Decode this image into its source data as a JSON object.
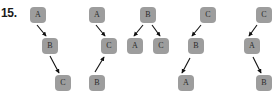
{
  "problem": {
    "number_label": "15.",
    "colors": {
      "node_fill": "#9d9d9d",
      "node_text": "#2b2b2b",
      "arrow": "#111111",
      "background": "#ffffff",
      "number_text": "#1a1a1a"
    }
  },
  "diagrams": [
    {
      "id": "diagram-1",
      "nodes": [
        {
          "label": "A",
          "x": 30,
          "y": 7
        },
        {
          "label": "B",
          "x": 42,
          "y": 38
        },
        {
          "label": "C",
          "x": 55,
          "y": 75
        }
      ],
      "edges": [
        {
          "from": "A",
          "to": "B",
          "x1": 37,
          "y1": 25,
          "x2": 46,
          "y2": 36
        },
        {
          "from": "B",
          "to": "C",
          "x1": 50,
          "y1": 56,
          "x2": 59,
          "y2": 73
        }
      ]
    },
    {
      "id": "diagram-2",
      "nodes": [
        {
          "label": "A",
          "x": 89,
          "y": 7
        },
        {
          "label": "C",
          "x": 101,
          "y": 38
        },
        {
          "label": "B",
          "x": 89,
          "y": 75
        }
      ],
      "edges": [
        {
          "from": "A",
          "to": "C",
          "x1": 96,
          "y1": 25,
          "x2": 105,
          "y2": 36
        },
        {
          "from": "B",
          "to": "C",
          "x1": 95,
          "y1": 72,
          "x2": 104,
          "y2": 57
        }
      ]
    },
    {
      "id": "diagram-3",
      "nodes": [
        {
          "label": "B",
          "x": 140,
          "y": 7
        },
        {
          "label": "A",
          "x": 127,
          "y": 38
        },
        {
          "label": "C",
          "x": 153,
          "y": 38
        }
      ],
      "edges": [
        {
          "from": "B",
          "to": "A",
          "x1": 143,
          "y1": 25,
          "x2": 134,
          "y2": 36
        },
        {
          "from": "B",
          "to": "C",
          "x1": 152,
          "y1": 25,
          "x2": 160,
          "y2": 36
        }
      ]
    },
    {
      "id": "diagram-4",
      "nodes": [
        {
          "label": "C",
          "x": 200,
          "y": 7
        },
        {
          "label": "B",
          "x": 188,
          "y": 38
        },
        {
          "label": "A",
          "x": 178,
          "y": 75
        }
      ],
      "edges": [
        {
          "from": "C",
          "to": "B",
          "x1": 201,
          "y1": 25,
          "x2": 192,
          "y2": 36
        },
        {
          "from": "B",
          "to": "A",
          "x1": 190,
          "y1": 58,
          "x2": 182,
          "y2": 73
        }
      ]
    },
    {
      "id": "diagram-5",
      "nodes": [
        {
          "label": "C",
          "x": 256,
          "y": 7
        },
        {
          "label": "A",
          "x": 244,
          "y": 38
        },
        {
          "label": "B",
          "x": 256,
          "y": 75
        }
      ],
      "edges": [
        {
          "from": "C",
          "to": "A",
          "x1": 257,
          "y1": 25,
          "x2": 249,
          "y2": 36
        },
        {
          "from": "A",
          "to": "B",
          "x1": 253,
          "y1": 57,
          "x2": 261,
          "y2": 73
        }
      ]
    }
  ]
}
